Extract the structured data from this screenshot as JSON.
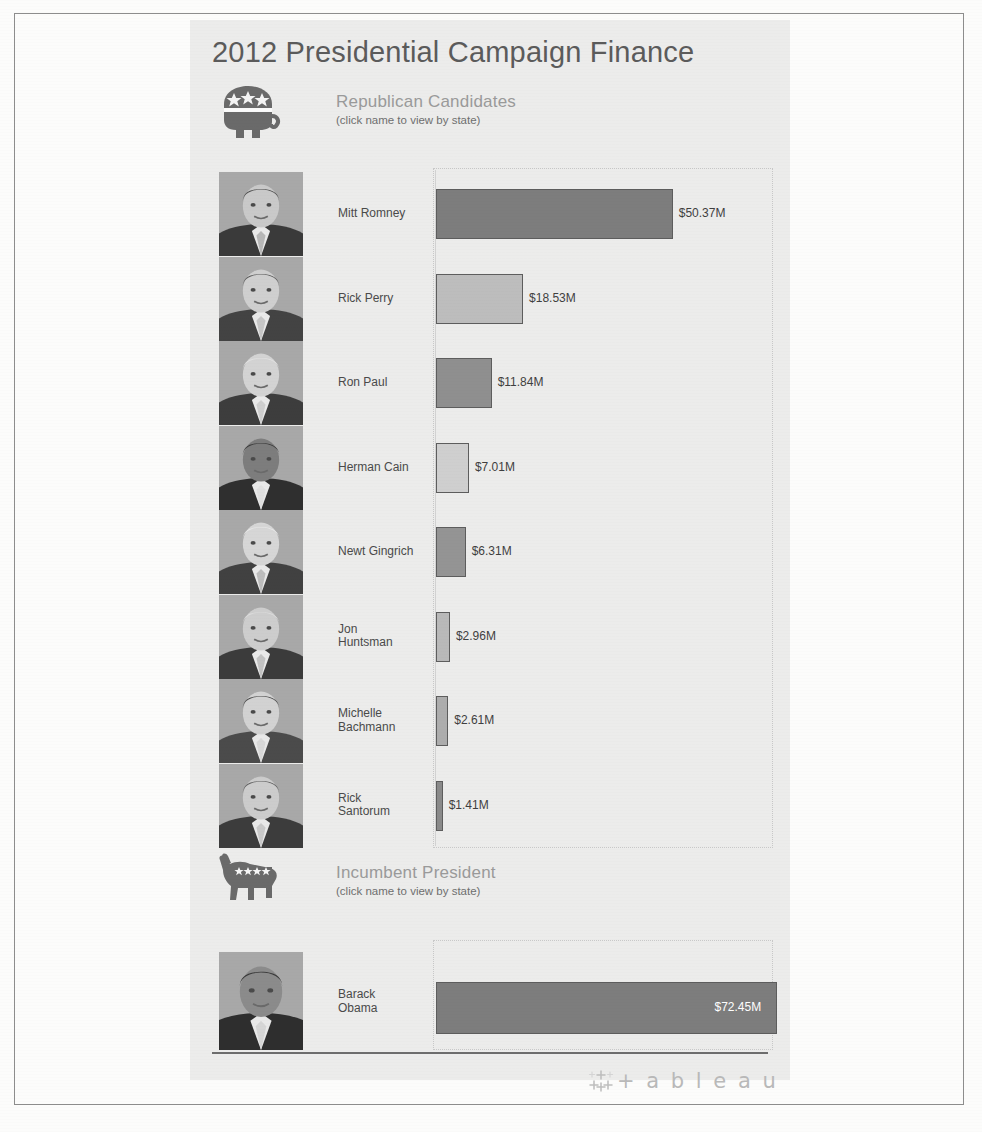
{
  "title": "2012 Presidential Campaign Finance",
  "sections": {
    "republican": {
      "heading": "Republican Candidates",
      "subheading": "(click name to view by state)",
      "logo_icon": "republican-elephant-icon"
    },
    "democrat": {
      "heading": "Incumbent President",
      "subheading": "(click name to view by state)",
      "logo_icon": "democrat-donkey-icon"
    }
  },
  "footer": {
    "logo_mark_icon": "tableau-sparkle-icon",
    "wordmark": "+ a b l e a u"
  },
  "chart_data": {
    "type": "bar",
    "title": "2012 Presidential Campaign Finance",
    "xlabel": "",
    "ylabel": "",
    "orientation": "horizontal",
    "value_unit": "millions USD",
    "xlim": [
      0,
      75
    ],
    "grid": false,
    "legend": "none",
    "panels": [
      {
        "name": "Republican Candidates",
        "categories": [
          "Mitt Romney",
          "Rick Perry",
          "Ron Paul",
          "Herman Cain",
          "Newt Gingrich",
          "Jon Huntsman",
          "Michelle Bachmann",
          "Rick Santorum"
        ],
        "values": [
          50.37,
          18.53,
          11.84,
          7.01,
          6.31,
          2.96,
          2.61,
          1.41
        ],
        "labels": [
          "$50.37M",
          "$18.53M",
          "$11.84M",
          "$7.01M",
          "$6.31M",
          "$2.96M",
          "$2.61M",
          "$1.41M"
        ],
        "colors": [
          "#7d7d7d",
          "#bdbdbd",
          "#8f8f8f",
          "#cfcfcf",
          "#949494",
          "#b9b9b9",
          "#adadad",
          "#8a8a8a"
        ],
        "axis_max": 75
      },
      {
        "name": "Incumbent President",
        "categories": [
          "Barack Obama"
        ],
        "values": [
          72.45
        ],
        "labels": [
          "$72.45M"
        ],
        "colors": [
          "#7d7d7d"
        ],
        "axis_max": 75
      }
    ]
  },
  "candidates": [
    {
      "name_line1": "Mitt Romney",
      "name_line2": "",
      "value_label": "$50.37M",
      "photo": "portrait-mitt-romney"
    },
    {
      "name_line1": "Rick Perry",
      "name_line2": "",
      "value_label": "$18.53M",
      "photo": "portrait-rick-perry"
    },
    {
      "name_line1": "Ron Paul",
      "name_line2": "",
      "value_label": "$11.84M",
      "photo": "portrait-ron-paul"
    },
    {
      "name_line1": "Herman Cain",
      "name_line2": "",
      "value_label": "$7.01M",
      "photo": "portrait-herman-cain"
    },
    {
      "name_line1": "Newt Gingrich",
      "name_line2": "",
      "value_label": "$6.31M",
      "photo": "portrait-newt-gingrich"
    },
    {
      "name_line1": "Jon",
      "name_line2": "Huntsman",
      "value_label": "$2.96M",
      "photo": "portrait-jon-huntsman"
    },
    {
      "name_line1": "Michelle",
      "name_line2": "Bachmann",
      "value_label": "$2.61M",
      "photo": "portrait-michelle-bachmann"
    },
    {
      "name_line1": "Rick",
      "name_line2": "Santorum",
      "value_label": "$1.41M",
      "photo": "portrait-rick-santorum"
    }
  ],
  "incumbent": {
    "name_line1": "Barack",
    "name_line2": "Obama",
    "value_label": "$72.45M",
    "photo": "portrait-barack-obama"
  }
}
